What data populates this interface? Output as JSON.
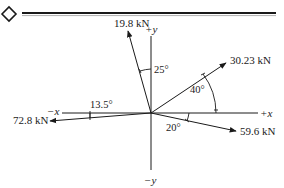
{
  "header": {
    "marker_icon": "diamond-icon"
  },
  "diagram": {
    "type": "force-vector-diagram",
    "axes": {
      "pos_x": "+x",
      "neg_x": "−x",
      "pos_y": "+y",
      "neg_y": "−y"
    },
    "forces": [
      {
        "label": "19.8 kN",
        "magnitude_kN": 19.8,
        "angle_text": "25°",
        "angle_ref": "from +y toward −x"
      },
      {
        "label": "30.23 kN",
        "magnitude_kN": 30.23,
        "angle_text": "40°",
        "angle_ref": "from +x toward +y"
      },
      {
        "label": "72.8 kN",
        "magnitude_kN": 72.8,
        "angle_text": "13.5°",
        "angle_ref": "from −x toward −y"
      },
      {
        "label": "59.6 kN",
        "magnitude_kN": 59.6,
        "angle_text": "20°",
        "angle_ref": "from +x toward −y"
      }
    ]
  }
}
